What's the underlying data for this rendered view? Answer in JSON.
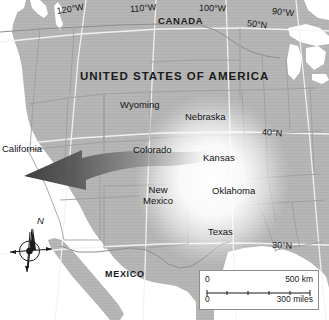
{
  "map": {
    "title_visible": false,
    "projection_note": "conic",
    "countries": [
      {
        "id": "canada",
        "label": "CANADA",
        "x": 158,
        "y": 16
      },
      {
        "id": "usa",
        "label": "UNITED STATES OF AMERICA",
        "x": 80,
        "y": 70
      },
      {
        "id": "mexico",
        "label": "MEXICO",
        "x": 105,
        "y": 270
      }
    ],
    "states": [
      {
        "id": "california",
        "label": "California",
        "x": 2,
        "y": 144,
        "align": "left"
      },
      {
        "id": "wyoming",
        "label": "Wyoming",
        "x": 120,
        "y": 100,
        "align": "left"
      },
      {
        "id": "nebraska",
        "label": "Nebraska",
        "x": 185,
        "y": 112,
        "align": "left"
      },
      {
        "id": "colorado",
        "label": "Colorado",
        "x": 133,
        "y": 145,
        "align": "left"
      },
      {
        "id": "kansas",
        "label": "Kansas",
        "x": 203,
        "y": 153,
        "align": "left"
      },
      {
        "id": "new-mexico",
        "label": "New\nMexico",
        "x": 143,
        "y": 185,
        "align": "center"
      },
      {
        "id": "oklahoma",
        "label": "Oklahoma",
        "x": 212,
        "y": 186,
        "align": "left"
      },
      {
        "id": "texas",
        "label": "Texas",
        "x": 208,
        "y": 227,
        "align": "left"
      }
    ],
    "graticule_labels": [
      {
        "id": "lon-120w",
        "label": "120°W",
        "x": 57,
        "y": 7,
        "rotate": -9
      },
      {
        "id": "lon-110w",
        "label": "110°W",
        "x": 130,
        "y": 5,
        "rotate": -4
      },
      {
        "id": "lon-100w",
        "label": "100°W",
        "x": 199,
        "y": 4,
        "rotate": 1
      },
      {
        "id": "lon-90w",
        "label": "90°W",
        "x": 272,
        "y": 7,
        "rotate": 6
      },
      {
        "id": "lat-50n",
        "label": "50°N",
        "x": 247,
        "y": 19,
        "rotate": 7
      },
      {
        "id": "lat-40n",
        "label": "40°N",
        "x": 262,
        "y": 128,
        "rotate": 4
      },
      {
        "id": "lat-30n",
        "label": "30°N",
        "x": 272,
        "y": 241,
        "rotate": 2
      }
    ],
    "scalebar": {
      "km_zero": "0",
      "km_value": "500 km",
      "miles_zero": "0",
      "miles_value": "300 miles"
    },
    "compass": {
      "north_label": "N"
    },
    "annotations": [
      {
        "id": "migration-arrow",
        "type": "arrow",
        "description": "large tapering arrow pointing west from the Great Plains toward California"
      },
      {
        "id": "source-glow",
        "type": "radial-highlight",
        "description": "bright radial highlight centered over the southern Great Plains"
      }
    ],
    "colors": {
      "land": "#b4b4b4",
      "land_edge": "#a8a8a8",
      "water": "#ffffff",
      "border": "#8a8a8a",
      "state_border": "#9a9a9a",
      "graticule": "#f2f2f2",
      "text": "#1b1b1b",
      "arrow_dark": "#4a4a4a",
      "glow": "#ffffff"
    }
  }
}
